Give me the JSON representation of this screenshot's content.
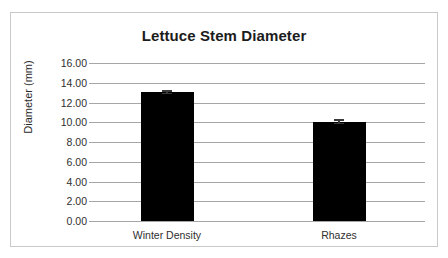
{
  "chart_data": {
    "type": "bar",
    "title": "Lettuce Stem Diameter",
    "xlabel": "",
    "ylabel": "Diameter (mm)",
    "categories": [
      "Winter Density",
      "Rhazes"
    ],
    "values": [
      13.05,
      10.05
    ],
    "errors": [
      0.2,
      0.25
    ],
    "ylim": [
      0,
      16
    ],
    "ytick_step": 2,
    "ytick_labels": [
      "16.00",
      "14.00",
      "12.00",
      "10.00",
      "8.00",
      "6.00",
      "4.00",
      "2.00",
      "0.00"
    ],
    "ytick_values": [
      16,
      14,
      12,
      10,
      8,
      6,
      4,
      2,
      0
    ],
    "grid": true,
    "legend": false,
    "series": [
      {
        "name": "Diameter",
        "values": [
          13.05,
          10.05
        ],
        "errors": [
          0.2,
          0.25
        ],
        "color": "#000000"
      }
    ],
    "colors": {
      "bar": "#000000",
      "gridline": "#a6a6a6",
      "border": "#c9c9c9",
      "text": "#2f2f2f",
      "title": "#1c1c1c",
      "errorbar": "#3a3a3a",
      "background": "#ffffff"
    }
  }
}
